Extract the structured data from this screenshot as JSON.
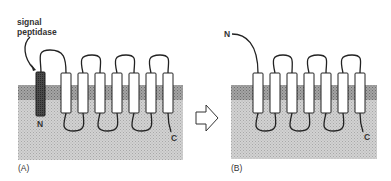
{
  "figure": {
    "panel_a": {
      "label": "(A)",
      "callout": [
        "signal",
        "peptidase"
      ],
      "n_terminus": "N",
      "c_terminus": "C",
      "helix_count": 7,
      "signal_sequence": "dark transmembrane segment cleaved by signal peptidase"
    },
    "arrow": {
      "direction": "right"
    },
    "panel_b": {
      "label": "(B)",
      "n_terminus": "N",
      "c_terminus": "C",
      "helix_count": 7
    },
    "colors": {
      "membrane_band": "#9a9a9a",
      "lumen": "#c8c8c8",
      "signal_segment": "#444444",
      "helix_fill": "#ffffff",
      "line": "#222222"
    }
  }
}
